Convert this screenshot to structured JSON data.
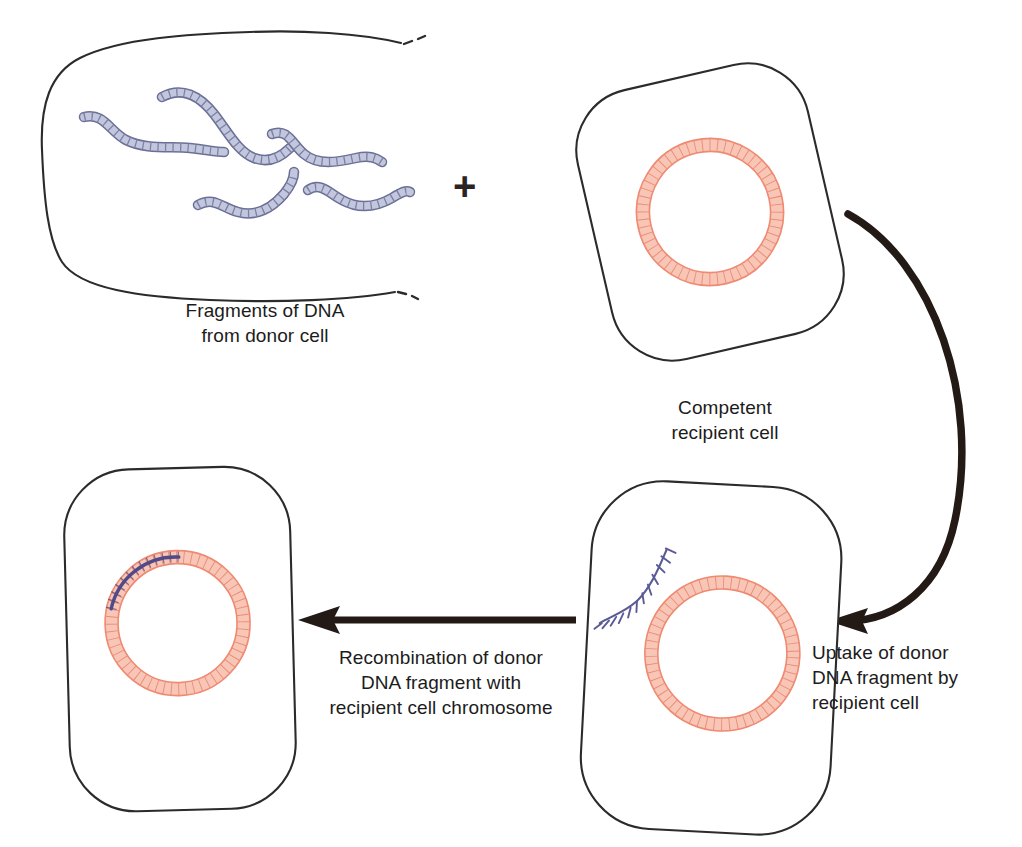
{
  "figure": {
    "background": "#ffffff"
  },
  "palette": {
    "outline": "#2b2b2b",
    "arrow": "#231a16",
    "donor_dna_fill": "#c3c7de",
    "donor_dna_stroke": "#6b6f95",
    "chromosome_fill": "#f8c6b6",
    "chromosome_stroke": "#ef8a72",
    "chromosome_tick": "#e8705a",
    "integrated_dna": "#514a86",
    "ssdna_stroke": "#5a5a96",
    "text": "#1c1c1c"
  },
  "symbols": {
    "plus": "+"
  },
  "labels": {
    "donor": "Fragments of DNA\nfrom donor cell",
    "competent": "Competent\nrecipient cell",
    "uptake": "Uptake of donor\nDNA fragment by\nrecipient cell",
    "recombination": "Recombination of donor\nDNA fragment with\nrecipient cell chromosome"
  },
  "stages": [
    {
      "id": "donor-cell",
      "name": "Lysed donor cell",
      "label": "Fragments of DNA\nfrom donor cell",
      "fragment_count": 5,
      "outline_style": "broken",
      "contents": "free double-stranded DNA fragments"
    },
    {
      "id": "competent-cell",
      "name": "Competent recipient cell",
      "label": "Competent\nrecipient cell",
      "outline_style": "solid-rounded",
      "contents": "circular chromosome"
    },
    {
      "id": "uptake-cell",
      "name": "Recipient cell taking up donor DNA",
      "label": "Uptake of donor\nDNA fragment by\nrecipient cell",
      "outline_style": "solid-rounded",
      "contents": "circular chromosome plus incoming single-stranded donor DNA"
    },
    {
      "id": "recombinant-cell",
      "name": "Transformed recombinant cell",
      "label": "Recombination of donor\nDNA fragment with\nrecipient cell chromosome",
      "outline_style": "solid-rounded",
      "contents": "circular chromosome with integrated donor DNA segment"
    }
  ],
  "arrows": [
    {
      "id": "uptake-arrow",
      "name": "curved arrow from competent cell to uptake cell",
      "shape": "curved",
      "direction": "clockwise-down-left"
    },
    {
      "id": "recombination-arrow",
      "name": "straight arrow from uptake cell to recombinant cell",
      "shape": "straight",
      "direction": "left"
    }
  ]
}
